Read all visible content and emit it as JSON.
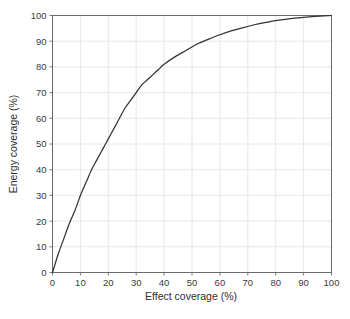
{
  "chart_data": {
    "type": "line",
    "title": "",
    "xlabel": "Effect coverage (%)",
    "ylabel": "Energy coverage (%)",
    "xlim": [
      0,
      100
    ],
    "ylim": [
      0,
      100
    ],
    "grid": true,
    "legend": "none",
    "xticks": [
      "0",
      "10",
      "20",
      "30",
      "40",
      "50",
      "60",
      "70",
      "80",
      "90",
      "100"
    ],
    "yticks": [
      "0",
      "10",
      "20",
      "30",
      "40",
      "50",
      "60",
      "70",
      "80",
      "90",
      "100"
    ],
    "series": [
      {
        "name": "energy vs effect coverage",
        "color": "#333333",
        "x": [
          0,
          2,
          4,
          6,
          8,
          10,
          12,
          14,
          16,
          18,
          20,
          22,
          24,
          26,
          28,
          30,
          32,
          34,
          36,
          38,
          40,
          44,
          48,
          52,
          56,
          60,
          64,
          68,
          72,
          76,
          80,
          84,
          88,
          92,
          96,
          100
        ],
        "y": [
          0,
          7,
          13,
          19,
          24,
          30,
          35,
          40,
          44,
          48,
          52,
          56,
          60,
          64,
          67,
          70,
          73,
          75,
          77,
          79,
          81,
          84,
          86.5,
          89,
          90.8,
          92.5,
          94,
          95.2,
          96.3,
          97.2,
          98,
          98.6,
          99.1,
          99.5,
          99.8,
          100
        ]
      }
    ]
  },
  "colors": {
    "line": "#333333",
    "axis": "#6b6b6b",
    "grid": "#e6e6ec",
    "tick_label": "#3a3a3a",
    "axis_title": "#2e2e2e",
    "background": "#ffffff"
  }
}
